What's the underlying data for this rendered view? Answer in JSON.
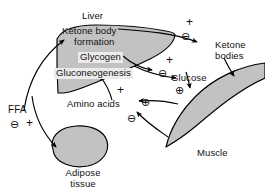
{
  "diagram": {
    "type": "biochemical-pathway",
    "colors": {
      "organ_fill": "#c2c2c2",
      "organ_stroke": "#000000",
      "label_box_fill": "#eceaea",
      "text": "#111111",
      "background": "#ffffff"
    },
    "organs": [
      {
        "id": "liver",
        "label": "Liver"
      },
      {
        "id": "adipose",
        "label_line1": "Adipose",
        "label_line2": "tissue"
      },
      {
        "id": "muscle",
        "label": "Muscle"
      }
    ],
    "liver_processes": [
      {
        "id": "ketone-body-formation",
        "line1": "Ketone body",
        "line2": "formation",
        "boxed": false
      },
      {
        "id": "glycogen",
        "line1": "Glycogen",
        "boxed": true
      },
      {
        "id": "gluconeogenesis",
        "line1": "Gluconeogenesis",
        "boxed": true
      }
    ],
    "metabolites": [
      {
        "id": "ffa",
        "label": "FFA"
      },
      {
        "id": "ketone-bodies",
        "line1": "Ketone",
        "line2": "bodies"
      },
      {
        "id": "glucose",
        "label": "Glucose"
      },
      {
        "id": "amino-acids",
        "label": "Amino acids"
      }
    ],
    "regulatory_symbols": [
      {
        "id": "plus-ketone-output",
        "glyph": "+",
        "circled": false,
        "near": "ketone body output arrow"
      },
      {
        "id": "minus-ketone-output",
        "glyph": "⊖",
        "circled": true,
        "near": "ketone body output arrow"
      },
      {
        "id": "plus-glucose-output",
        "glyph": "+",
        "circled": false,
        "near": "glucose output arrow"
      },
      {
        "id": "minus-glucose-output",
        "glyph": "⊖",
        "circled": true,
        "near": "glucose label"
      },
      {
        "id": "plus-glucose-uptake",
        "glyph": "⊕",
        "circled": true,
        "near": "glucose to muscle"
      },
      {
        "id": "plus-amino-acid-release",
        "glyph": "⊕",
        "circled": true,
        "near": "muscle amino acid release"
      },
      {
        "id": "minus-muscle-uptake",
        "glyph": "⊖",
        "circled": true,
        "near": "muscle uptake arrow"
      },
      {
        "id": "plus-gluconeogenesis",
        "glyph": "+",
        "circled": false,
        "near": "amino acid to gluconeogenesis"
      },
      {
        "id": "minus-ffa-release",
        "glyph": "⊖",
        "circled": true,
        "near": "FFA release from adipose"
      },
      {
        "id": "plus-ffa-release",
        "glyph": "+",
        "circled": false,
        "near": "FFA release from adipose"
      }
    ],
    "arrows": [
      {
        "id": "ffa-to-liver",
        "from": "ffa",
        "to": "ketone-body-formation"
      },
      {
        "id": "liver-to-ketone-bodies",
        "from": "liver",
        "to": "ketone-bodies"
      },
      {
        "id": "ketone-bodies-to-muscle",
        "from": "ketone-bodies",
        "to": "muscle"
      },
      {
        "id": "liver-to-glucose",
        "from": "glycogen",
        "to": "glucose"
      },
      {
        "id": "glucose-to-muscle",
        "from": "glucose",
        "to": "muscle"
      },
      {
        "id": "muscle-to-amino-acids",
        "from": "muscle",
        "to": "amino-acids"
      },
      {
        "id": "amino-acids-to-gluconeogenesis",
        "from": "amino-acids",
        "to": "gluconeogenesis"
      },
      {
        "id": "muscle-inhibit",
        "from": "muscle",
        "to": "amino-acids"
      },
      {
        "id": "adipose-to-ffa",
        "from": "adipose",
        "to": "ffa"
      }
    ]
  }
}
